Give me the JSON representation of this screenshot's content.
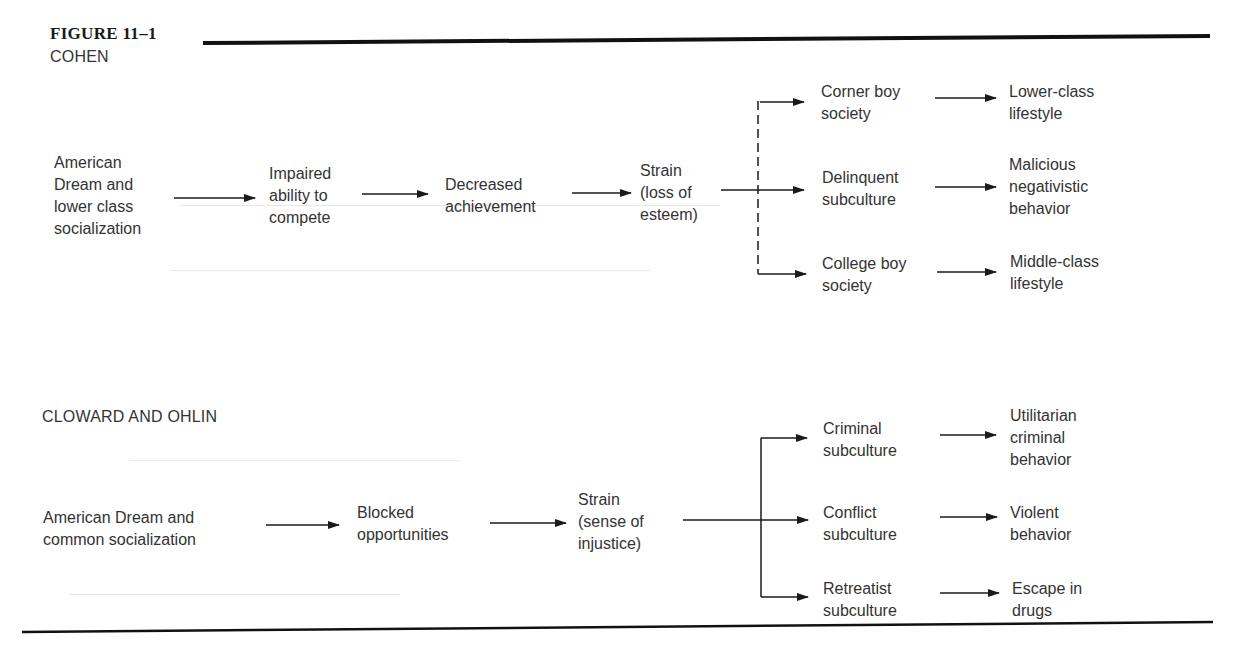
{
  "figure": {
    "title": "FIGURE 11–1"
  },
  "cohen": {
    "title": "COHEN",
    "nodes": {
      "start": "American\nDream and\nlower class\nsocialization",
      "impaired": "Impaired\nability to\ncompete",
      "decreased": "Decreased\nachievement",
      "strain": "Strain\n(loss of\nesteem)",
      "corner_boy": "Corner boy\nsociety",
      "delinquent": "Delinquent\nsubculture",
      "college_boy": "College boy\nsociety",
      "lower_class": "Lower-class\nlifestyle",
      "malicious": "Malicious\nnegativistic\nbehavior",
      "middle_class": "Middle-class\nlifestyle"
    },
    "branch_style": "dashed"
  },
  "cloward_ohlin": {
    "title": "CLOWARD AND OHLIN",
    "nodes": {
      "start": "American Dream and\ncommon socialization",
      "blocked": "Blocked\nopportunities",
      "strain": "Strain\n(sense of\ninjustice)",
      "criminal": "Criminal\nsubculture",
      "conflict": "Conflict\nsubculture",
      "retreatist": "Retreatist\nsubculture",
      "utilitarian": "Utilitarian\ncriminal\nbehavior",
      "violent": "Violent\nbehavior",
      "escape": "Escape in\ndrugs"
    },
    "branch_style": "solid"
  },
  "colors": {
    "text": "#333333",
    "lines": "#1a1a1a",
    "rule": "#111111"
  }
}
